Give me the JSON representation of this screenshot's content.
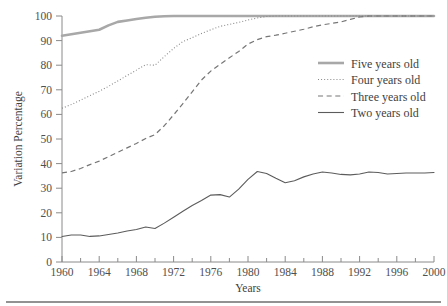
{
  "figure": {
    "background_color": "#ffffff",
    "rule_color": "#6e6e6e"
  },
  "chart_data": {
    "type": "line",
    "title": "",
    "xlabel": "Years",
    "ylabel": "Variation Percentage",
    "xlim": [
      1960,
      2000
    ],
    "ylim": [
      0,
      100
    ],
    "grid": false,
    "legend_position": "right-top",
    "x_ticks": [
      1960,
      1964,
      1968,
      1972,
      1976,
      1980,
      1984,
      1988,
      1992,
      1996,
      2000
    ],
    "x_minor_ticks": [
      1962,
      1966,
      1970,
      1974,
      1978,
      1982,
      1986,
      1990,
      1994,
      1998
    ],
    "y_ticks": [
      0,
      10,
      20,
      30,
      40,
      50,
      60,
      70,
      80,
      90,
      100
    ],
    "x": [
      1960,
      1961,
      1962,
      1963,
      1964,
      1965,
      1966,
      1967,
      1968,
      1969,
      1970,
      1971,
      1972,
      1973,
      1974,
      1975,
      1976,
      1977,
      1978,
      1979,
      1980,
      1981,
      1982,
      1983,
      1984,
      1985,
      1986,
      1987,
      1988,
      1989,
      1990,
      1991,
      1992,
      1993,
      1994,
      1995,
      1996,
      1997,
      1998,
      1999,
      2000
    ],
    "series": [
      {
        "name": "Five years old",
        "style": "solid-thick",
        "color": "#a8a8a8",
        "width": 2.6,
        "values": [
          92.0,
          92.6,
          93.2,
          93.8,
          94.4,
          96.2,
          97.6,
          98.2,
          98.8,
          99.3,
          99.7,
          99.9,
          100.0,
          100.0,
          100.0,
          100.0,
          100.0,
          100.0,
          100.0,
          100.0,
          100.0,
          100.0,
          100.0,
          100.0,
          100.0,
          100.0,
          100.0,
          100.0,
          100.0,
          100.0,
          100.0,
          100.0,
          100.0,
          100.0,
          100.0,
          100.0,
          100.0,
          100.0,
          100.0,
          100.0,
          100.0
        ]
      },
      {
        "name": "Four years old",
        "style": "dotted",
        "color": "#888888",
        "width": 1.1,
        "values": [
          62.5,
          64.0,
          65.8,
          67.6,
          69.4,
          71.4,
          73.6,
          75.8,
          78.0,
          80.2,
          80.0,
          83.5,
          86.8,
          89.6,
          91.2,
          92.9,
          94.4,
          95.8,
          96.6,
          97.4,
          98.4,
          99.2,
          99.8,
          100.0,
          100.0,
          100.0,
          100.0,
          100.0,
          100.0,
          100.0,
          100.0,
          100.0,
          100.0,
          100.0,
          100.0,
          100.0,
          100.0,
          100.0,
          100.0,
          100.0,
          100.0
        ]
      },
      {
        "name": "Three years old",
        "style": "dashed",
        "color": "#767676",
        "width": 1.2,
        "values": [
          36.2,
          36.8,
          38.0,
          39.6,
          41.0,
          42.8,
          44.6,
          46.4,
          48.2,
          50.2,
          51.8,
          55.4,
          59.8,
          64.4,
          69.2,
          74.0,
          77.6,
          80.4,
          83.0,
          85.6,
          88.6,
          90.4,
          91.6,
          92.2,
          93.0,
          93.8,
          94.6,
          95.6,
          96.4,
          97.0,
          97.6,
          98.6,
          99.6,
          100.0,
          100.0,
          100.0,
          100.0,
          100.0,
          100.0,
          100.0,
          100.0
        ]
      },
      {
        "name": "Two years old",
        "style": "solid-thin",
        "color": "#5c5c5c",
        "width": 1.1,
        "values": [
          10.4,
          11.0,
          11.0,
          10.4,
          10.6,
          11.2,
          11.8,
          12.6,
          13.2,
          14.2,
          13.6,
          15.8,
          18.2,
          20.6,
          23.0,
          25.0,
          27.2,
          27.4,
          26.4,
          29.6,
          33.6,
          36.8,
          36.0,
          34.0,
          32.2,
          33.0,
          34.6,
          35.8,
          36.6,
          36.2,
          35.6,
          35.4,
          35.8,
          36.6,
          36.4,
          35.8,
          36.0,
          36.2,
          36.2,
          36.2,
          36.4
        ]
      }
    ]
  },
  "legend": {
    "items": [
      {
        "label": "Five years old"
      },
      {
        "label": "Four years old"
      },
      {
        "label": "Three years old"
      },
      {
        "label": "Two years old"
      }
    ]
  }
}
